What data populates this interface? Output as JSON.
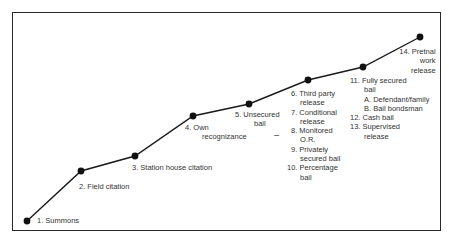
{
  "diagram": {
    "type": "ordered-progression",
    "points": [
      {
        "x": 27,
        "y": 221
      },
      {
        "x": 81,
        "y": 171
      },
      {
        "x": 135,
        "y": 156
      },
      {
        "x": 193,
        "y": 116
      },
      {
        "x": 249,
        "y": 104
      },
      {
        "x": 308,
        "y": 80
      },
      {
        "x": 363,
        "y": 67
      },
      {
        "x": 420,
        "y": 37
      }
    ],
    "line_color": "#1a1a1a",
    "dot_color": "#111111"
  },
  "labels": {
    "summons": "1.  Summons",
    "field_citation": "2.  Field citation",
    "station_house": "3.  Station house citation",
    "own_rec_1": "4.  Own",
    "own_rec_2": "recognizance",
    "unsecured_1": "5.  Unsecured",
    "unsecured_2": "bail",
    "g6_1": "6.  Third party",
    "g6_2": "release",
    "g7_1": "7.  Conditional",
    "g7_2": "release",
    "g8_1": "8.  Monitored",
    "g8_2": "O.R.",
    "g9_1": "9.  Privately",
    "g9_2": "secured bail",
    "g10_1": "10.  Percentage",
    "g10_2": "bail",
    "g11_1": "11.  Fully secured",
    "g11_2": "bail",
    "g11_a": "A.  Defendant/family",
    "g11_b": "B.  Bail bondsman",
    "g12": "12.  Cash bail",
    "g13_1": "13.  Supervised",
    "g13_2": "release",
    "g14_1": "14. Pretnal",
    "g14_2": "work",
    "g14_3": "release",
    "dash_mark": "–"
  }
}
